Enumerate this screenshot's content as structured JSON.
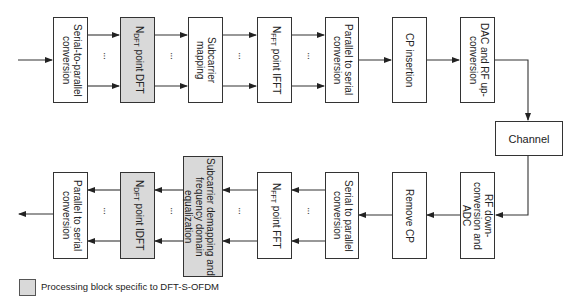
{
  "diagram": {
    "colors": {
      "shaded_block": "#d9d9d9",
      "line": "#333333",
      "background": "#ffffff"
    },
    "transmitter": [
      {
        "id": "tx1",
        "label": "Serial-to-parallel conversion",
        "shaded": false
      },
      {
        "id": "tx2",
        "label_main": "N",
        "label_sub": "DFT",
        "label_rest": " point DFT",
        "shaded": true
      },
      {
        "id": "tx3",
        "label": "Subcarrier mapping",
        "shaded": false
      },
      {
        "id": "tx4",
        "label_main": "N",
        "label_sub": "FFT",
        "label_rest": " point IFFT",
        "shaded": false
      },
      {
        "id": "tx5",
        "label": "Parallel to serial conversion",
        "shaded": false
      },
      {
        "id": "tx6",
        "label": "CP insertion",
        "shaded": false
      },
      {
        "id": "tx7",
        "label": "DAC and RF up-conversion",
        "shaded": false
      }
    ],
    "channel": {
      "label": "Channel"
    },
    "receiver": [
      {
        "id": "rx1",
        "label": "RF down-conversion and ADC",
        "shaded": false
      },
      {
        "id": "rx2",
        "label": "Remove CP",
        "shaded": false
      },
      {
        "id": "rx3",
        "label": "Serial to parallel conversion",
        "shaded": false
      },
      {
        "id": "rx4",
        "label_main": "N",
        "label_sub": "FFT",
        "label_rest": " point FFT",
        "shaded": false
      },
      {
        "id": "rx5",
        "label": "Subcarrier demapping and frequency domain equalization",
        "shaded": true
      },
      {
        "id": "rx6",
        "label_main": "N",
        "label_sub": "DFT",
        "label_rest": " point IDFT",
        "shaded": true
      },
      {
        "id": "rx7",
        "label": "Parallel to serial conversion",
        "shaded": false
      }
    ],
    "ellipsis": "···",
    "legend": {
      "label": "Processing block specific to DFT-S-OFDM"
    }
  }
}
